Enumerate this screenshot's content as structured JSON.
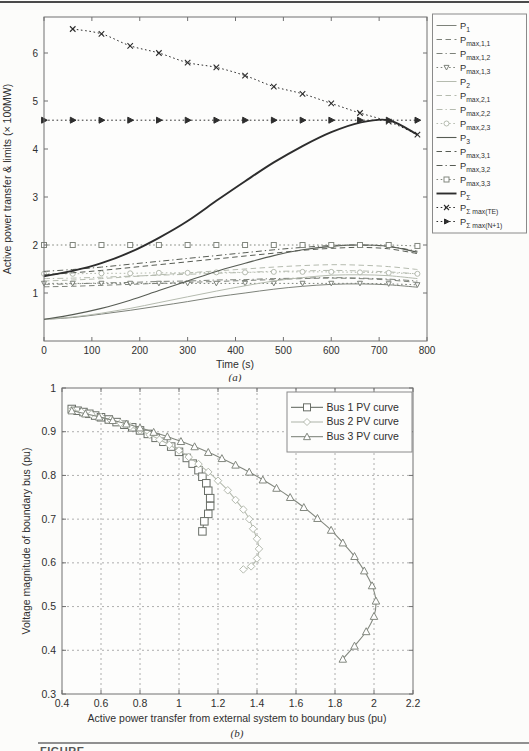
{
  "page": {
    "top_rule_color": "#4a4a4a",
    "bottom_rule_color": "#909090",
    "partial_caption": "FIGURE"
  },
  "chart_data": [
    {
      "id": "a",
      "type": "line",
      "caption": "(a)",
      "xlabel": "Time (s)",
      "ylabel": "Active power transfer & limits (× 100MW)",
      "xlim": [
        0,
        800
      ],
      "ylim": [
        0,
        6.75
      ],
      "xticks": [
        0,
        100,
        200,
        300,
        400,
        500,
        600,
        700,
        800
      ],
      "xticklabels": [
        "0",
        "100",
        "200",
        "300",
        "400",
        "500",
        "600",
        "700",
        "800"
      ],
      "yticks": [
        1,
        2,
        3,
        4,
        5,
        6
      ],
      "yticklabels": [
        "1",
        "2",
        "3",
        "4",
        "5",
        "6"
      ],
      "grid": false,
      "legend_position": "outside-right",
      "series": [
        {
          "name": "P_1",
          "label": {
            "base": "P",
            "sub": "1"
          },
          "style": "solid",
          "marker": "none",
          "color": "#7d827a",
          "width": 1,
          "x": [
            0,
            60,
            120,
            180,
            240,
            300,
            360,
            420,
            480,
            540,
            600,
            660,
            720,
            780
          ],
          "y": [
            0.45,
            0.49,
            0.56,
            0.64,
            0.73,
            0.82,
            0.92,
            1.0,
            1.08,
            1.14,
            1.18,
            1.19,
            1.17,
            1.12
          ]
        },
        {
          "name": "P_max_1_1",
          "label": {
            "base": "P",
            "sub": "max,1,1"
          },
          "style": "dashed",
          "marker": "none",
          "color": "#7d827a",
          "width": 1,
          "x": [
            0,
            60,
            120,
            180,
            240,
            300,
            360,
            420,
            480,
            540,
            600,
            660,
            720,
            780
          ],
          "y": [
            1.13,
            1.14,
            1.16,
            1.18,
            1.2,
            1.22,
            1.24,
            1.26,
            1.28,
            1.3,
            1.31,
            1.3,
            1.27,
            1.22
          ]
        },
        {
          "name": "P_max_1_2",
          "label": {
            "base": "P",
            "sub": "max,1,2"
          },
          "style": "dashdot",
          "marker": "none",
          "color": "#7d827a",
          "width": 1,
          "x": [
            0,
            60,
            120,
            180,
            240,
            300,
            360,
            420,
            480,
            540,
            600,
            660,
            720,
            780
          ],
          "y": [
            1.18,
            1.19,
            1.21,
            1.22,
            1.24,
            1.25,
            1.27,
            1.28,
            1.3,
            1.31,
            1.32,
            1.31,
            1.29,
            1.25
          ]
        },
        {
          "name": "P_max_1_3",
          "label": {
            "base": "P",
            "sub": "max,1,3"
          },
          "style": "dotted",
          "marker": "triangle-down",
          "color": "#7d827a",
          "width": 1,
          "x": [
            0,
            60,
            120,
            180,
            240,
            300,
            360,
            420,
            480,
            540,
            600,
            660,
            720,
            780
          ],
          "y": [
            1.2,
            1.2,
            1.2,
            1.2,
            1.2,
            1.2,
            1.2,
            1.2,
            1.2,
            1.2,
            1.2,
            1.2,
            1.19,
            1.17
          ]
        },
        {
          "name": "P_2",
          "label": {
            "base": "P",
            "sub": "2"
          },
          "style": "solid",
          "marker": "none",
          "color": "#b5bbaf",
          "width": 1,
          "x": [
            0,
            60,
            120,
            180,
            240,
            300,
            360,
            420,
            480,
            540,
            600,
            660,
            720,
            780
          ],
          "y": [
            0.45,
            0.5,
            0.58,
            0.68,
            0.8,
            0.92,
            1.04,
            1.15,
            1.25,
            1.32,
            1.37,
            1.38,
            1.36,
            1.3
          ]
        },
        {
          "name": "P_max_2_1",
          "label": {
            "base": "P",
            "sub": "max,2,1"
          },
          "style": "dashed",
          "marker": "none",
          "color": "#b5bbaf",
          "width": 1,
          "x": [
            0,
            60,
            120,
            180,
            240,
            300,
            360,
            420,
            480,
            540,
            600,
            660,
            720,
            780
          ],
          "y": [
            1.25,
            1.27,
            1.3,
            1.34,
            1.38,
            1.42,
            1.46,
            1.5,
            1.54,
            1.57,
            1.59,
            1.58,
            1.55,
            1.49
          ]
        },
        {
          "name": "P_max_2_2",
          "label": {
            "base": "P",
            "sub": "max,2,2"
          },
          "style": "dashdot",
          "marker": "none",
          "color": "#b5bbaf",
          "width": 1,
          "x": [
            0,
            60,
            120,
            180,
            240,
            300,
            360,
            420,
            480,
            540,
            600,
            660,
            720,
            780
          ],
          "y": [
            1.3,
            1.31,
            1.33,
            1.35,
            1.37,
            1.39,
            1.41,
            1.43,
            1.45,
            1.46,
            1.47,
            1.46,
            1.44,
            1.4
          ]
        },
        {
          "name": "P_max_2_3",
          "label": {
            "base": "P",
            "sub": "max,2,3"
          },
          "style": "dotted",
          "marker": "circle",
          "color": "#b5bbaf",
          "width": 1,
          "x": [
            0,
            60,
            120,
            180,
            240,
            300,
            360,
            420,
            480,
            540,
            600,
            660,
            720,
            780
          ],
          "y": [
            1.4,
            1.4,
            1.41,
            1.41,
            1.42,
            1.42,
            1.43,
            1.43,
            1.44,
            1.44,
            1.44,
            1.43,
            1.42,
            1.4
          ]
        },
        {
          "name": "P_3",
          "label": {
            "base": "P",
            "sub": "3"
          },
          "style": "solid",
          "marker": "none",
          "color": "#575c54",
          "width": 1.1,
          "x": [
            0,
            60,
            120,
            180,
            240,
            300,
            360,
            420,
            480,
            540,
            600,
            660,
            720,
            780
          ],
          "y": [
            0.45,
            0.55,
            0.68,
            0.85,
            1.05,
            1.25,
            1.45,
            1.62,
            1.78,
            1.9,
            1.97,
            2.0,
            1.97,
            1.85
          ]
        },
        {
          "name": "P_max_3_1",
          "label": {
            "base": "P",
            "sub": "max,3,1"
          },
          "style": "dashed",
          "marker": "none",
          "color": "#575c54",
          "width": 1,
          "x": [
            0,
            60,
            120,
            180,
            240,
            300,
            360,
            420,
            480,
            540,
            600,
            660,
            720,
            780
          ],
          "y": [
            1.38,
            1.42,
            1.47,
            1.53,
            1.59,
            1.65,
            1.71,
            1.77,
            1.83,
            1.89,
            1.93,
            1.95,
            1.92,
            1.82
          ]
        },
        {
          "name": "P_max_3_2",
          "label": {
            "base": "P",
            "sub": "max,3,2"
          },
          "style": "dashdot",
          "marker": "none",
          "color": "#575c54",
          "width": 1,
          "x": [
            0,
            60,
            120,
            180,
            240,
            300,
            360,
            420,
            480,
            540,
            600,
            660,
            720,
            780
          ],
          "y": [
            1.45,
            1.49,
            1.54,
            1.6,
            1.66,
            1.72,
            1.78,
            1.84,
            1.9,
            1.95,
            1.99,
            2.0,
            1.97,
            1.87
          ]
        },
        {
          "name": "P_max_3_3",
          "label": {
            "base": "P",
            "sub": "max,3,3"
          },
          "style": "dotted",
          "marker": "square",
          "color": "#82877e",
          "width": 1,
          "x": [
            0,
            60,
            120,
            180,
            240,
            300,
            360,
            420,
            480,
            540,
            600,
            660,
            720,
            780
          ],
          "y": [
            2.0,
            2.0,
            2.0,
            2.0,
            2.0,
            2.0,
            2.0,
            2.0,
            2.0,
            2.0,
            2.0,
            2.0,
            2.0,
            1.98
          ]
        },
        {
          "name": "P_sigma",
          "label": {
            "base": "P",
            "sub": "Σ"
          },
          "style": "solid",
          "marker": "none",
          "color": "#2d2d2d",
          "width": 1.9,
          "x": [
            0,
            60,
            120,
            180,
            240,
            300,
            360,
            420,
            480,
            540,
            600,
            660,
            720,
            780
          ],
          "y": [
            1.35,
            1.46,
            1.62,
            1.85,
            2.15,
            2.5,
            2.92,
            3.33,
            3.72,
            4.06,
            4.35,
            4.55,
            4.6,
            4.3
          ]
        },
        {
          "name": "P_sigma_max_TE",
          "label": {
            "base": "P",
            "sub": "Σ max(TE)"
          },
          "style": "dotted",
          "marker": "x",
          "color": "#2d2d2d",
          "width": 1,
          "x": [
            60,
            120,
            180,
            240,
            300,
            360,
            420,
            480,
            540,
            600,
            660,
            720,
            780
          ],
          "y": [
            6.5,
            6.4,
            6.15,
            6.0,
            5.8,
            5.7,
            5.53,
            5.3,
            5.15,
            4.95,
            4.75,
            4.57,
            4.3
          ]
        },
        {
          "name": "P_sigma_max_N1",
          "label": {
            "base": "P",
            "sub": "Σ max(N+1)"
          },
          "style": "dotted",
          "marker": "triangle-right",
          "color": "#2d2d2d",
          "width": 1,
          "x": [
            0,
            60,
            120,
            180,
            240,
            300,
            360,
            420,
            480,
            540,
            600,
            660,
            720,
            780
          ],
          "y": [
            4.6,
            4.6,
            4.6,
            4.6,
            4.6,
            4.6,
            4.6,
            4.6,
            4.6,
            4.6,
            4.6,
            4.6,
            4.6,
            4.6
          ]
        }
      ]
    },
    {
      "id": "b",
      "type": "line",
      "caption": "(b)",
      "xlabel": "Active power transfer from external system to boundary bus (pu)",
      "ylabel": "Voltage magnitude of boundary bus (pu)",
      "xlim": [
        0.4,
        2.2
      ],
      "ylim": [
        0.3,
        1.0
      ],
      "xticks": [
        0.4,
        0.6,
        0.8,
        1.0,
        1.2,
        1.4,
        1.6,
        1.8,
        2.0,
        2.2
      ],
      "xticklabels": [
        "0.4",
        "0.6",
        "0.8",
        "1",
        "1.2",
        "1.4",
        "1.6",
        "1.8",
        "2",
        "2.2"
      ],
      "yticks": [
        0.3,
        0.4,
        0.5,
        0.6,
        0.7,
        0.8,
        0.9,
        1.0
      ],
      "yticklabels": [
        "0.3",
        "0.4",
        "0.5",
        "0.6",
        "0.7",
        "0.8",
        "0.9",
        "1"
      ],
      "grid": true,
      "legend_position": "inside-top-right",
      "series": [
        {
          "name": "bus1_pv",
          "label": "Bus 1 PV curve",
          "style": "solid",
          "marker": "square",
          "color": "#696e67",
          "width": 1.1,
          "x": [
            0.45,
            0.48,
            0.51,
            0.54,
            0.57,
            0.6,
            0.64,
            0.68,
            0.72,
            0.76,
            0.8,
            0.84,
            0.88,
            0.92,
            0.96,
            1.0,
            1.04,
            1.07,
            1.1,
            1.12,
            1.14,
            1.15,
            1.16,
            1.16,
            1.15,
            1.13,
            1.12
          ],
          "y": [
            0.952,
            0.948,
            0.945,
            0.941,
            0.937,
            0.933,
            0.928,
            0.922,
            0.916,
            0.91,
            0.903,
            0.895,
            0.886,
            0.877,
            0.866,
            0.854,
            0.84,
            0.827,
            0.812,
            0.797,
            0.782,
            0.765,
            0.748,
            0.73,
            0.712,
            0.695,
            0.672
          ]
        },
        {
          "name": "bus2_pv",
          "label": "Bus 2 PV curve",
          "style": "solid",
          "marker": "diamond",
          "color": "#b5bbaf",
          "width": 1.1,
          "x": [
            0.45,
            0.5,
            0.55,
            0.6,
            0.65,
            0.7,
            0.75,
            0.8,
            0.85,
            0.9,
            0.95,
            1.0,
            1.05,
            1.1,
            1.15,
            1.2,
            1.25,
            1.29,
            1.33,
            1.36,
            1.38,
            1.4,
            1.41,
            1.4,
            1.37,
            1.33
          ],
          "y": [
            0.95,
            0.945,
            0.94,
            0.934,
            0.927,
            0.92,
            0.912,
            0.903,
            0.893,
            0.882,
            0.87,
            0.857,
            0.842,
            0.826,
            0.808,
            0.788,
            0.766,
            0.744,
            0.722,
            0.7,
            0.678,
            0.655,
            0.632,
            0.61,
            0.592,
            0.585
          ]
        },
        {
          "name": "bus3_pv",
          "label": "Bus 3 PV curve",
          "style": "solid",
          "marker": "triangle-up",
          "color": "#82877e",
          "width": 1.1,
          "x": [
            0.45,
            0.52,
            0.59,
            0.66,
            0.73,
            0.8,
            0.87,
            0.94,
            1.01,
            1.08,
            1.15,
            1.22,
            1.29,
            1.36,
            1.43,
            1.5,
            1.57,
            1.64,
            1.71,
            1.78,
            1.84,
            1.9,
            1.95,
            1.99,
            2.01,
            2.0,
            1.96,
            1.9,
            1.84
          ],
          "y": [
            0.948,
            0.941,
            0.934,
            0.926,
            0.918,
            0.909,
            0.899,
            0.889,
            0.878,
            0.866,
            0.853,
            0.839,
            0.824,
            0.808,
            0.79,
            0.771,
            0.75,
            0.727,
            0.702,
            0.675,
            0.646,
            0.615,
            0.582,
            0.548,
            0.513,
            0.478,
            0.443,
            0.41,
            0.38
          ]
        }
      ]
    }
  ]
}
